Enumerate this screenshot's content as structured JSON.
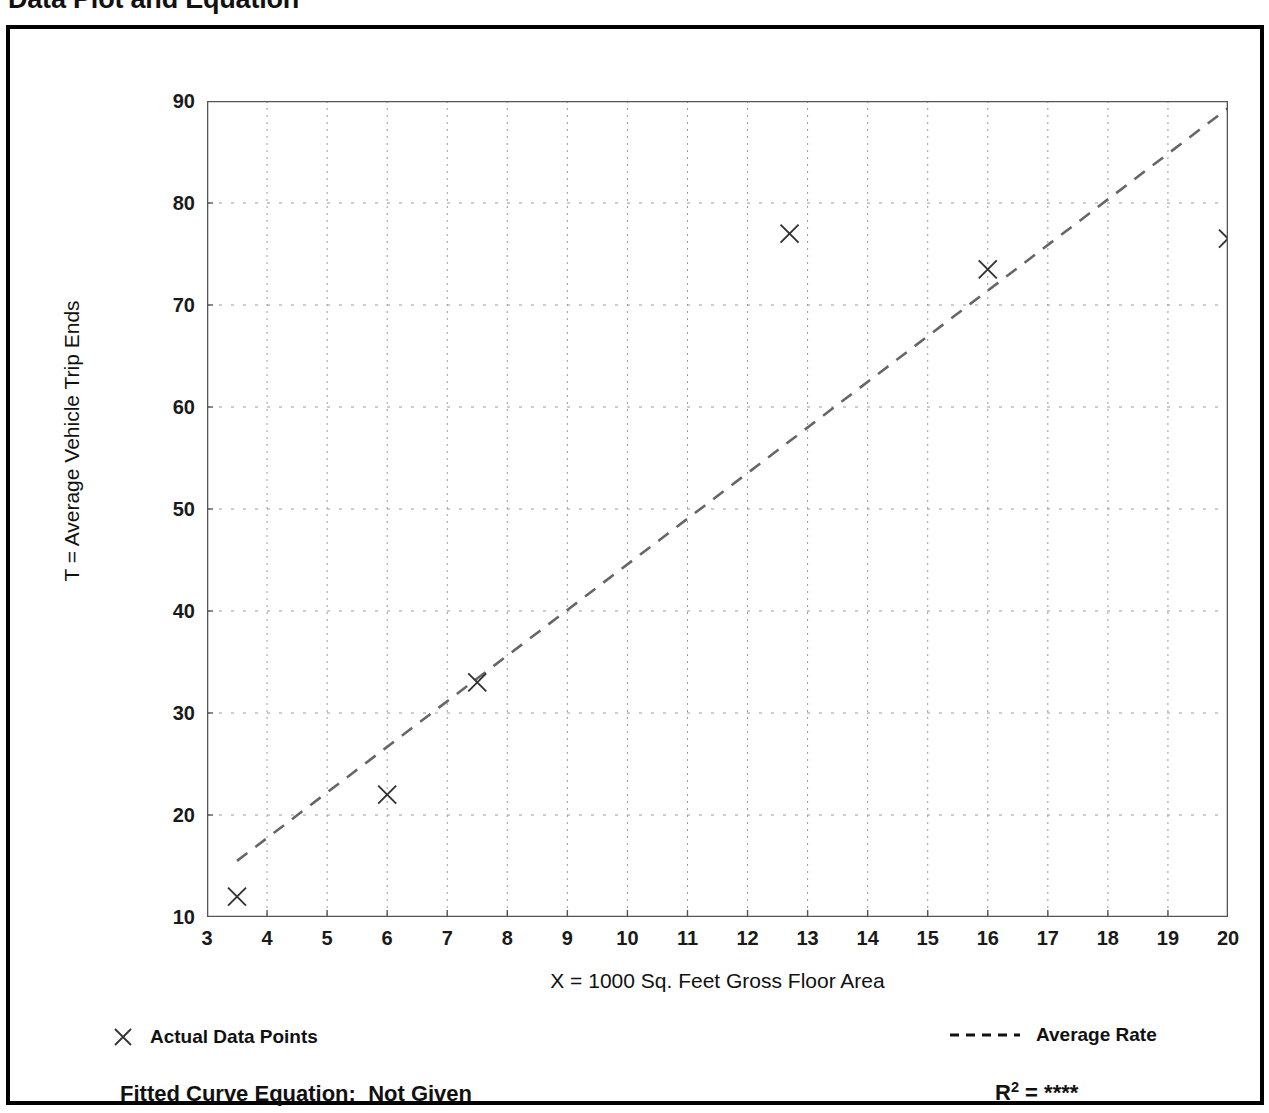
{
  "title": "Data Plot and Equation",
  "axes": {
    "ylabel": "T = Average Vehicle Trip Ends",
    "xlabel": "X = 1000 Sq. Feet Gross Floor Area"
  },
  "legend": {
    "points_label": "Actual Data Points",
    "points_marker": "x-marker-icon",
    "line_label": "Average Rate",
    "line_marker": "dashed-line-icon"
  },
  "footer": {
    "equation_label": "Fitted Curve Equation:",
    "equation_value": "Not Given",
    "equation_full": "Fitted Curve Equation:  Not Given",
    "r2_symbol": "R",
    "r2_exponent": "2",
    "r2_equals": "=",
    "r2_value": "****",
    "r2_full": "R2 = ****"
  },
  "colors": {
    "ink": "#000000",
    "grid": "#9a9a9a",
    "axis": "#555555",
    "marker": "#333333",
    "fit_line": "#666666",
    "background": "#ffffff"
  },
  "chart_data": {
    "type": "scatter",
    "title": "Data Plot and Equation",
    "xlabel": "X = 1000 Sq. Feet Gross Floor Area",
    "ylabel": "T = Average Vehicle Trip Ends",
    "xlim": [
      3,
      20
    ],
    "ylim": [
      10,
      90
    ],
    "xticks": [
      3,
      4,
      5,
      6,
      7,
      8,
      9,
      10,
      11,
      12,
      13,
      14,
      15,
      16,
      17,
      18,
      19,
      20
    ],
    "xtick_labels": [
      "3",
      "4",
      "5",
      "6",
      "7",
      "8",
      "9",
      "10",
      "11",
      "12",
      "13",
      "14",
      "15",
      "16",
      "17",
      "18",
      "19",
      "20"
    ],
    "yticks": [
      10,
      20,
      30,
      40,
      50,
      60,
      70,
      80,
      90
    ],
    "ytick_labels": [
      "10",
      "20",
      "30",
      "40",
      "50",
      "60",
      "70",
      "80",
      "90"
    ],
    "x_minor_step": 0.5,
    "y_minor_step": 5,
    "grid": true,
    "grid_style": "dotted",
    "legend_position": "below-plot",
    "series": [
      {
        "name": "Actual Data Points",
        "type": "scatter",
        "marker": "x",
        "points": [
          {
            "x": 3.5,
            "y": 12.0
          },
          {
            "x": 6.0,
            "y": 22.0
          },
          {
            "x": 7.5,
            "y": 33.0
          },
          {
            "x": 12.7,
            "y": 77.0
          },
          {
            "x": 16.0,
            "y": 73.5
          },
          {
            "x": 20.0,
            "y": 76.5
          }
        ]
      },
      {
        "name": "Average Rate",
        "type": "line",
        "style": "dashed",
        "endpoints": [
          {
            "x": 3.5,
            "y": 15.5
          },
          {
            "x": 20.0,
            "y": 89.3
          }
        ]
      }
    ]
  }
}
